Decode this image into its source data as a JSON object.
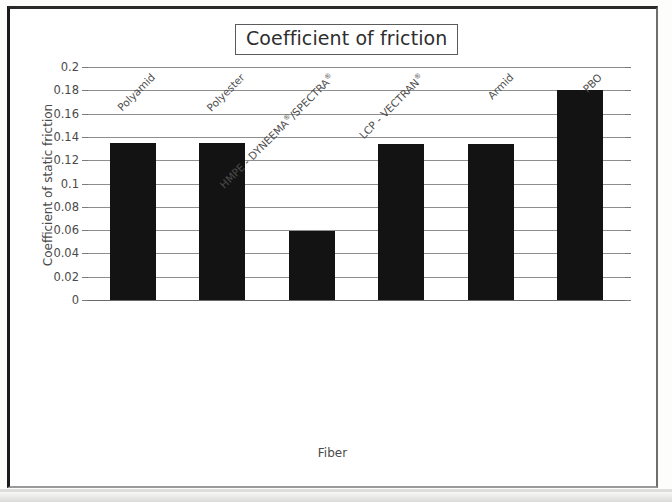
{
  "chart_data": {
    "type": "bar",
    "title": "Coefficient of friction",
    "xlabel": "Fiber",
    "ylabel": "Coefficient of static friction",
    "categories": [
      "Polyamid",
      "Polyester",
      "HMPE - DYNEEMA®/SPECTRA®",
      "LCP - VECTRAN®",
      "Armid",
      "PBO"
    ],
    "values": [
      0.135,
      0.135,
      0.059,
      0.134,
      0.134,
      0.18
    ],
    "ylim": [
      0,
      0.2
    ],
    "ytick_labels": [
      "0.2",
      "0.18",
      "0.16",
      "0.14",
      "0.12",
      "0.1",
      "0.08",
      "0.06",
      "0.04",
      "0.02",
      "0"
    ],
    "ytick_values": [
      0.2,
      0.18,
      0.16,
      0.14,
      0.12,
      0.1,
      0.08,
      0.06,
      0.04,
      0.02,
      0
    ],
    "grid": true,
    "legend": null,
    "bar_color": "#131313",
    "grid_color": "#8e8e8e",
    "text_color": "#4a4a4a"
  }
}
